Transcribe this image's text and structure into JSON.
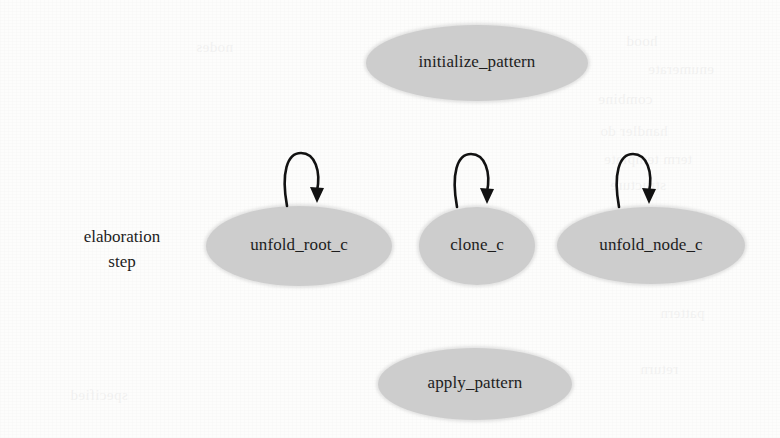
{
  "figure": {
    "type": "state-transition-diagram",
    "axis_label": {
      "line1": "elaboration",
      "line2": "step"
    },
    "node_fill_color": "#cdcdcd",
    "text_color": "#1d1d1d",
    "edge_color": "#121212",
    "background_color": "#fdfdfc",
    "nodes": [
      {
        "id": "initialize_pattern",
        "label": "initialize_pattern",
        "shape": "ellipse",
        "x": 366,
        "y": 25,
        "w": 222,
        "h": 76,
        "self_loop": false
      },
      {
        "id": "unfold_root_c",
        "label": "unfold_root_c",
        "shape": "ellipse",
        "x": 206,
        "y": 206,
        "w": 186,
        "h": 80,
        "self_loop": true
      },
      {
        "id": "clone_c",
        "label": "clone_c",
        "shape": "ellipse",
        "x": 419,
        "y": 207,
        "w": 116,
        "h": 78,
        "self_loop": true
      },
      {
        "id": "unfold_node_c",
        "label": "unfold_node_c",
        "shape": "ellipse",
        "x": 557,
        "y": 207,
        "w": 188,
        "h": 77,
        "self_loop": true
      },
      {
        "id": "apply_pattern",
        "label": "apply_pattern",
        "shape": "ellipse",
        "x": 378,
        "y": 348,
        "w": 194,
        "h": 72,
        "self_loop": false
      }
    ],
    "self_loops": [
      {
        "for": "unfold_root_c",
        "x": 281,
        "y": 149,
        "w": 44,
        "h": 56
      },
      {
        "for": "clone_c",
        "x": 451,
        "y": 150,
        "w": 44,
        "h": 56
      },
      {
        "for": "unfold_node_c",
        "x": 613,
        "y": 150,
        "w": 44,
        "h": 56
      }
    ],
    "bleed_through_lines": [
      {
        "text": "hood",
        "x": 626,
        "y": 28
      },
      {
        "text": "nodes",
        "x": 196,
        "y": 34
      },
      {
        "text": "enumerate",
        "x": 648,
        "y": 56
      },
      {
        "text": "combine",
        "x": 598,
        "y": 86
      },
      {
        "text": "handler do",
        "x": 600,
        "y": 118
      },
      {
        "text": "term template",
        "x": 604,
        "y": 146
      },
      {
        "text": "structure",
        "x": 610,
        "y": 172
      },
      {
        "text": "expand",
        "x": 616,
        "y": 200
      },
      {
        "text": "computed",
        "x": 598,
        "y": 260
      },
      {
        "text": "pattern",
        "x": 660,
        "y": 300
      },
      {
        "text": "return",
        "x": 640,
        "y": 356
      },
      {
        "text": "specified",
        "x": 70,
        "y": 382
      }
    ]
  }
}
